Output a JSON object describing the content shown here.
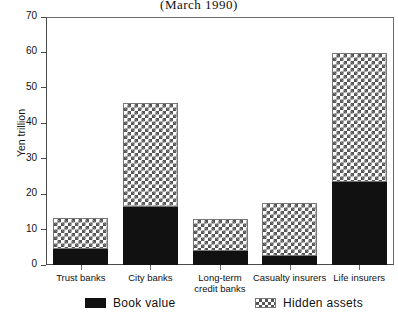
{
  "chart_data": {
    "type": "bar",
    "subtype": "stacked-vertical",
    "title": "(March 1990)",
    "xlabel": "",
    "ylabel": "Yen trillion",
    "ylim": [
      0,
      70
    ],
    "ytick_step": 10,
    "yticks": [
      0,
      10,
      20,
      30,
      40,
      50,
      60,
      70
    ],
    "ytick_labels": [
      "0",
      "10",
      "20",
      "30",
      "40",
      "50",
      "60",
      "70"
    ],
    "grid": false,
    "legend_position": "bottom",
    "categories": [
      "Trust banks",
      "City banks",
      "Long-term\ncredit banks",
      "Casualty insurers",
      "Life insurers"
    ],
    "series": [
      {
        "name": "Book value",
        "color": "#111111",
        "pattern": "solid",
        "values": [
          4.5,
          16.5,
          4.0,
          2.6,
          23.5
        ]
      },
      {
        "name": "Hidden assets",
        "color": "#555555",
        "pattern": "cross-hatch",
        "values": [
          8.5,
          29.0,
          8.8,
          14.7,
          36.0
        ]
      }
    ],
    "totals": [
      13.0,
      45.5,
      12.8,
      17.3,
      59.5
    ]
  },
  "legend": {
    "entries": [
      {
        "label": "Book value",
        "swatch": "solid-black-swatch"
      },
      {
        "label": "Hidden assets",
        "swatch": "cross-hatch-swatch"
      }
    ]
  },
  "colors": {
    "book_value": "#111111",
    "hidden_assets": "#555555",
    "axis": "#4a4a4a",
    "background": "#ffffff"
  }
}
